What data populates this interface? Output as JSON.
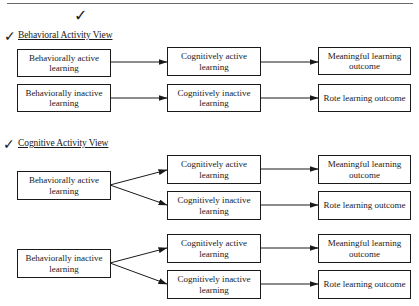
{
  "header": {
    "rule": true
  },
  "sections": [
    {
      "title": "Behavioral Activity View",
      "rows": [
        {
          "left": "Behaviorally active learning",
          "middle": "Cognitively active learning",
          "right": "Meaningful learning outcome"
        },
        {
          "left": "Behaviorally inactive learning",
          "middle": "Cognitively inactive learning",
          "right": "Rote learning outcome"
        }
      ]
    },
    {
      "title": "Cognitive Activity View",
      "groups": [
        {
          "left": "Behaviorally active learning",
          "branches": [
            {
              "middle": "Cognitively active learning",
              "right": "Meaningful learning outcome"
            },
            {
              "middle": "Cognitively inactive learning",
              "right": "Rote learning outcome"
            }
          ]
        },
        {
          "left": "Behaviorally inactive learning",
          "branches": [
            {
              "middle": "Cognitively active learning",
              "right": "Meaningful learning outcome"
            },
            {
              "middle": "Cognitively inactive learning",
              "right": "Rote learning outcome"
            }
          ]
        }
      ]
    }
  ],
  "annotations": {
    "checkmark": "✓"
  }
}
